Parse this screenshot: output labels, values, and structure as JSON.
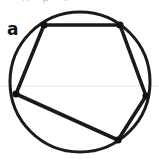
{
  "figure": {
    "panel_label": "a",
    "clipped_header_fragment": "n p t",
    "background_color": "#ffffff",
    "stroke_color": "#1a1a1a",
    "vertex_color": "#111111",
    "baseline_color": "#e6e6e6",
    "width": 159,
    "height": 160
  },
  "chart_data": {
    "type": "diagram",
    "title": "",
    "subtitle": "",
    "shapes": [
      {
        "name": "circumscribed-circle",
        "kind": "circle",
        "cx": 80,
        "cy": 82,
        "r": 70,
        "stroke": "#1a1a1a",
        "stroke_width": 3,
        "fill": "none"
      },
      {
        "name": "inscribed-pentagon",
        "kind": "polygon",
        "stroke": "#1a1a1a",
        "stroke_width": 3.6,
        "fill": "none",
        "points": [
          {
            "label": "top-left-vertex",
            "x": 44,
            "y": 25
          },
          {
            "label": "top-right-vertex",
            "x": 120,
            "y": 25
          },
          {
            "label": "right-vertex",
            "x": 146,
            "y": 96
          },
          {
            "label": "bottom-vertex",
            "x": 118,
            "y": 140
          },
          {
            "label": "left-vertex",
            "x": 16,
            "y": 94
          }
        ]
      }
    ],
    "vertices": [
      {
        "label": "top-left-vertex",
        "x": 44,
        "y": 25,
        "marker": "dot",
        "radius": 3.6
      },
      {
        "label": "top-right-vertex",
        "x": 120,
        "y": 25,
        "marker": "dot",
        "radius": 3.6
      },
      {
        "label": "right-vertex",
        "x": 146,
        "y": 96,
        "marker": "dot",
        "radius": 3.6
      },
      {
        "label": "bottom-vertex",
        "x": 118,
        "y": 140,
        "marker": "dot",
        "radius": 3.6
      },
      {
        "label": "left-vertex",
        "x": 16,
        "y": 94,
        "marker": "dot",
        "radius": 3.6
      }
    ],
    "guides": [
      {
        "name": "faint-horizontal-rule",
        "kind": "line",
        "x1": 0,
        "y1": 86,
        "x2": 159,
        "y2": 86,
        "stroke": "#e6e6e6",
        "stroke_width": 1
      }
    ],
    "annotations": [
      {
        "name": "panel-label",
        "text": "a",
        "x": 7,
        "y": 21
      }
    ],
    "grid": false,
    "legend": null,
    "xlabel": "",
    "ylabel": ""
  }
}
